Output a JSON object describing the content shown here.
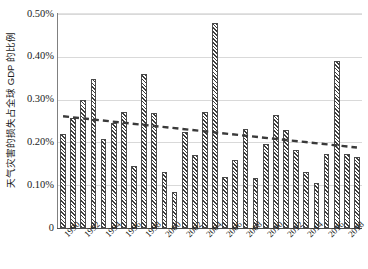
{
  "chart_data": {
    "type": "bar",
    "title": "",
    "subtitle": "",
    "xlabel": "",
    "ylabel": "天气灾害的损失占全球 GDP 的比例",
    "ylim": [
      0,
      0.5
    ],
    "ytick_values": [
      0,
      0.1,
      0.2,
      0.3,
      0.4,
      0.5
    ],
    "ytick_labels": [
      "0",
      "0.10%",
      "0.20%",
      "0.30%",
      "0.40%",
      "0.50%"
    ],
    "grid": "horizontal",
    "legend": "none",
    "unit": "%",
    "categories": [
      "1990",
      "1991",
      "1992",
      "1993",
      "1994",
      "1995",
      "1996",
      "1997",
      "1998",
      "1999",
      "2000",
      "2001",
      "2002",
      "2003",
      "2004",
      "2005",
      "2006",
      "2007",
      "2008",
      "2009",
      "2010",
      "2011",
      "2012",
      "2013",
      "2014",
      "2015",
      "2016",
      "2017",
      "2018",
      "2019"
    ],
    "xtick_labels": [
      "1990",
      "1992",
      "1994",
      "1996",
      "1998",
      "2000",
      "2002",
      "2004",
      "2006",
      "2008",
      "2010",
      "2012",
      "2014",
      "2016",
      "2018"
    ],
    "values": [
      0.219,
      0.258,
      0.298,
      0.348,
      0.207,
      0.245,
      0.272,
      0.144,
      0.361,
      0.269,
      0.131,
      0.085,
      0.224,
      0.171,
      0.271,
      0.478,
      0.119,
      0.158,
      0.231,
      0.116,
      0.196,
      0.263,
      0.229,
      0.182,
      0.132,
      0.105,
      0.172,
      0.391,
      0.173,
      0.165
    ],
    "series": [
      {
        "name": "天气灾害的损失占全球 GDP 的比例",
        "type": "bar",
        "values": [
          0.219,
          0.258,
          0.298,
          0.348,
          0.207,
          0.245,
          0.272,
          0.144,
          0.361,
          0.269,
          0.131,
          0.085,
          0.224,
          0.171,
          0.271,
          0.478,
          0.119,
          0.158,
          0.231,
          0.116,
          0.196,
          0.263,
          0.229,
          0.182,
          0.132,
          0.105,
          0.172,
          0.391,
          0.173,
          0.165
        ]
      },
      {
        "name": "趋势线",
        "type": "line",
        "style": "dashed",
        "start_value": 0.261,
        "end_value": 0.188,
        "values": [
          0.261,
          0.2585,
          0.256,
          0.2535,
          0.251,
          0.2485,
          0.246,
          0.2435,
          0.241,
          0.2385,
          0.236,
          0.2335,
          0.231,
          0.2285,
          0.226,
          0.2235,
          0.221,
          0.2185,
          0.216,
          0.2135,
          0.211,
          0.2085,
          0.206,
          0.2035,
          0.201,
          0.1985,
          0.196,
          0.1935,
          0.191,
          0.188
        ]
      }
    ],
    "colors": {
      "bar_fill": "#ffffff",
      "bar_hatch": "#3d3d3d",
      "bar_edge": "#4a4a4a",
      "trend_line": "#3a3a3a",
      "gridline": "#d9d9d9",
      "axis": "#4d4d4d",
      "text": "#1a1a1a"
    }
  }
}
